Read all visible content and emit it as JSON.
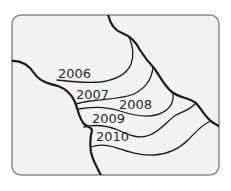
{
  "diagram": {
    "type": "map-contours",
    "frame": {
      "x": 12,
      "y": 15,
      "width": 207,
      "height": 160,
      "radius": 9,
      "fill": "#f2f2f2",
      "stroke": "#8a8a8a"
    },
    "labels": [
      {
        "text": "2006",
        "x": 58,
        "y": 78
      },
      {
        "text": "2007",
        "x": 76,
        "y": 100
      },
      {
        "text": "2008",
        "x": 119,
        "y": 109
      },
      {
        "text": "2009",
        "x": 92,
        "y": 123
      },
      {
        "text": "2010",
        "x": 96,
        "y": 141
      }
    ],
    "colors": {
      "line": "#1a1a1a",
      "text": "#2a2a2a",
      "background": "#ffffff"
    }
  }
}
